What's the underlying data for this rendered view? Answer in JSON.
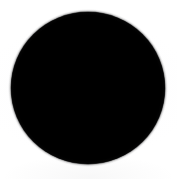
{
  "image": {
    "kind": "geometric-shape",
    "description": "Solid black filled circle on a plain white background",
    "canvas": {
      "width_px": 177,
      "height_px": 179,
      "background_color": "#fdfdfd"
    },
    "text_content": "",
    "shapes": [
      {
        "name": "black-circle",
        "type": "circle",
        "fill_color": "#000000",
        "stroke": "none",
        "center_x_px": 88,
        "center_y_px": 88,
        "width_px": 154,
        "height_px": 152,
        "left_px": 11,
        "top_px": 12,
        "right_px": 165,
        "bottom_px": 164,
        "edge": "soft anti-aliased"
      }
    ]
  }
}
